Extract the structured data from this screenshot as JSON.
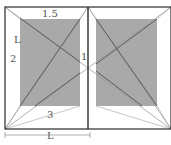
{
  "diagram": {
    "labels": {
      "top_margin": "1.5",
      "inner_margin": "1",
      "outer_margin": "2",
      "bottom_margin": "3",
      "side_L": "L",
      "width_L": "L"
    },
    "colors": {
      "page_border": "#2b2b2b",
      "text_block": "#a9a9a9",
      "diagonal_dark": "#555555",
      "diagonal_light": "#b5b5b5",
      "background": "#ffffff",
      "label": "#555555"
    }
  }
}
